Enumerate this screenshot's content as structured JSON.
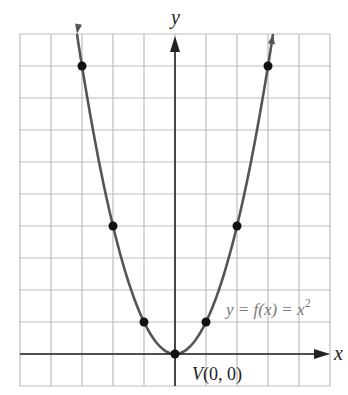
{
  "chart_data": {
    "type": "line",
    "title": "",
    "function_label": "y = f(x) = x²",
    "vertex_label": "V(0, 0)",
    "xlabel": "x",
    "ylabel": "y",
    "xlim": [
      -5,
      5
    ],
    "ylim": [
      -1,
      10
    ],
    "grid": true,
    "points": [
      {
        "x": -3,
        "y": 9
      },
      {
        "x": -2,
        "y": 4
      },
      {
        "x": -1,
        "y": 1
      },
      {
        "x": 0,
        "y": 0
      },
      {
        "x": 1,
        "y": 1
      },
      {
        "x": 2,
        "y": 4
      },
      {
        "x": 3,
        "y": 9
      }
    ],
    "colors": {
      "curve": "#555555",
      "grid": "#bbbbbb",
      "axis": "#222222",
      "points": "#111111",
      "label": "#777777"
    }
  },
  "labels": {
    "y_axis": "y",
    "x_axis": "x",
    "function": "y = f(x) = x",
    "function_exp": "2",
    "vertex": "V(0, 0)"
  }
}
